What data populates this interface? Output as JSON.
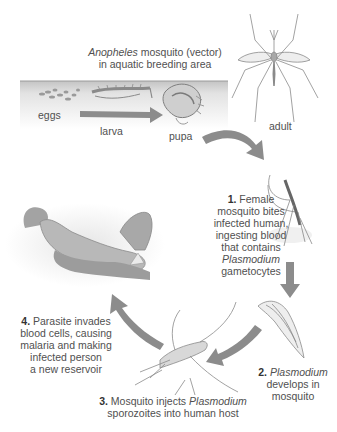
{
  "title": {
    "species": "Anopheles",
    "line1_rest": " mosquito (vector)",
    "line2": "in aquatic breeding area"
  },
  "stages": {
    "eggs": "eggs",
    "larva": "larva",
    "pupa": "pupa",
    "adult": "adult"
  },
  "steps": [
    {
      "number": "1.",
      "lines": [
        "Female",
        "mosquito bites",
        "infected human,",
        "ingesting blood",
        "that contains"
      ],
      "italic": "Plasmodium",
      "tail": "gametocytes"
    },
    {
      "number": "2.",
      "italic": "Plasmodium",
      "lines": [
        "develops in",
        "mosquito"
      ]
    },
    {
      "number": "3.",
      "pre": " Mosquito injects ",
      "italic": "Plasmodium",
      "line2": "sporozoites into human host"
    },
    {
      "number": "4.",
      "line1": " Parasite invades",
      "lines": [
        "blood cells, causing",
        "malaria and making",
        "infected person",
        "a new reservoir"
      ]
    }
  ],
  "colors": {
    "arrow": "#8c8c8c",
    "water_top": "#b8b8b8",
    "water_bottom": "#f4f4f4",
    "text": "#505050"
  }
}
